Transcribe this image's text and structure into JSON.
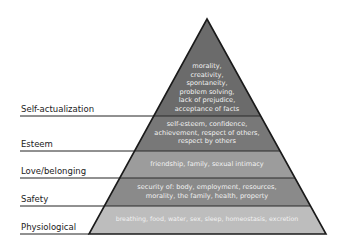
{
  "diagram": {
    "type": "pyramid",
    "levels": [
      {
        "label": "Self-actualization",
        "lines": [
          "morality,",
          "creativity,",
          "spontaneity,",
          "problem solving,",
          "lack of prejudice,",
          "acceptance of facts"
        ],
        "color": "#6b6b6b"
      },
      {
        "label": "Esteem",
        "lines": [
          "self-esteem, confidence,",
          "achievement, respect of others,",
          "respect by others"
        ],
        "color": "#787878"
      },
      {
        "label": "Love/belonging",
        "lines": [
          "friendship, family, sexual intimacy"
        ],
        "color": "#9c9c9c"
      },
      {
        "label": "Safety",
        "lines": [
          "security of: body, employment, resources,",
          "morality, the family, health, property"
        ],
        "color": "#8a8a8a"
      },
      {
        "label": "Physiological",
        "lines": [
          "breathing, food, water, sex, sleep, homeostasis, excretion"
        ],
        "color": "#bdbdbd"
      }
    ]
  }
}
